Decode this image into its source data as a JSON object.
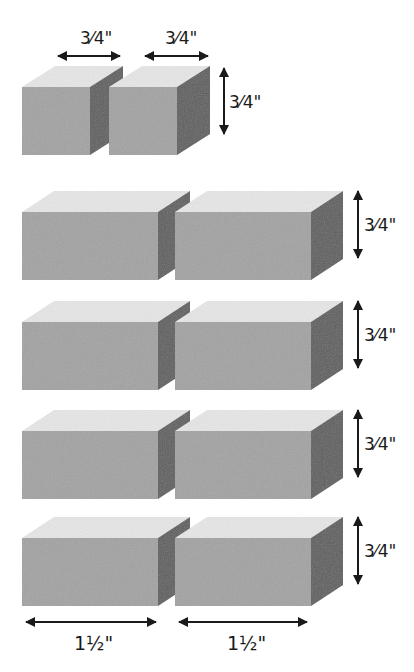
{
  "figure": {
    "colors": {
      "front": "#a3a3a3",
      "top": "#e6e6e6",
      "side": "#5e5e5e",
      "arrow": "#1a1a1a"
    },
    "cube_row": {
      "width_labels": [
        "3⁄4\"",
        "3⁄4\""
      ],
      "height_label": "3⁄4\""
    },
    "block_rows": [
      {
        "height_label": "3⁄4\""
      },
      {
        "height_label": "3⁄4\""
      },
      {
        "height_label": "3⁄4\""
      },
      {
        "height_label": "3⁄4\""
      }
    ],
    "bottom_width_labels": [
      "1½\"",
      "1½\""
    ]
  }
}
